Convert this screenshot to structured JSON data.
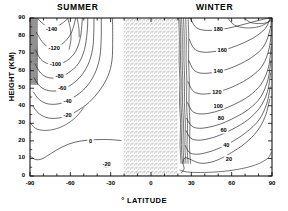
{
  "figure": {
    "summer_title": "SUMMER",
    "winter_title": "WINTER",
    "ylabel": "HEIGHT (KM)",
    "xlabel": "° LATITUDE"
  },
  "chart_data": {
    "type": "line",
    "title": "",
    "subtitle": "",
    "xlabel": "° LATITUDE",
    "ylabel": "HEIGHT (KM)",
    "xlim": [
      -90,
      90
    ],
    "ylim": [
      0,
      90
    ],
    "xticks": [
      -90,
      -60,
      -30,
      0,
      30,
      60,
      90
    ],
    "yticks": [
      0,
      10,
      20,
      30,
      40,
      50,
      60,
      70,
      80,
      90
    ],
    "xtick_labels": [
      "-90",
      "-60",
      "-30",
      "0",
      "30",
      "60",
      "90"
    ],
    "ytick_labels": [
      "0",
      "10",
      "20",
      "30",
      "40",
      "50",
      "60",
      "70",
      "80",
      "90"
    ],
    "minor_ticks": true,
    "grid": false,
    "legend": "none",
    "panel_labels": [
      "SUMMER",
      "WINTER"
    ],
    "contour_interval": 20,
    "contour_levels": [
      -140,
      -120,
      -100,
      -80,
      -60,
      -40,
      -20,
      0,
      20,
      40,
      60,
      80,
      100,
      120,
      140,
      160,
      180
    ],
    "summer_labels": [
      "-140",
      "-120",
      "-100",
      "-80",
      "-60",
      "-40",
      "-20",
      "0"
    ],
    "winter_labels": [
      "20",
      "40",
      "60",
      "80",
      "100",
      "120",
      "140",
      "160",
      "180"
    ],
    "shaded_region": {
      "label": "stippled tropics",
      "x_from": -20,
      "x_to": 20,
      "y_from": 0,
      "y_to": 90
    },
    "annotations": [
      {
        "text": "-140",
        "x": -74,
        "y": 84
      },
      {
        "text": "-120",
        "x": -72,
        "y": 73
      },
      {
        "text": "-100",
        "x": -71,
        "y": 64
      },
      {
        "text": "-80",
        "x": -68,
        "y": 57
      },
      {
        "text": "-60",
        "x": -66,
        "y": 50
      },
      {
        "text": "-40",
        "x": -62,
        "y": 43
      },
      {
        "text": "-20",
        "x": -62,
        "y": 35
      },
      {
        "text": "0",
        "x": -45,
        "y": 20
      },
      {
        "text": "-20",
        "x": -33,
        "y": 7
      },
      {
        "text": "180",
        "x": 50,
        "y": 84
      },
      {
        "text": "160",
        "x": 53,
        "y": 72
      },
      {
        "text": "140",
        "x": 50,
        "y": 60
      },
      {
        "text": "120",
        "x": 49,
        "y": 48
      },
      {
        "text": "100",
        "x": 50,
        "y": 40
      },
      {
        "text": "80",
        "x": 52,
        "y": 33
      },
      {
        "text": "60",
        "x": 54,
        "y": 26
      },
      {
        "text": "40",
        "x": 56,
        "y": 18
      },
      {
        "text": "20",
        "x": 58,
        "y": 10
      }
    ]
  }
}
